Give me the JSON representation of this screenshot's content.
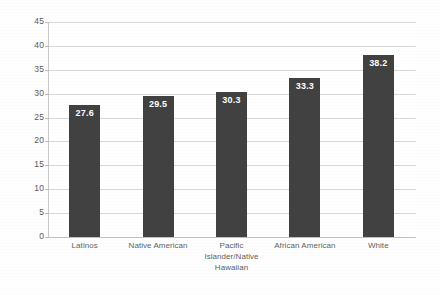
{
  "chart_data": {
    "type": "bar",
    "title": "",
    "subtitle": "",
    "xlabel": "",
    "ylabel": "",
    "categories": [
      "Latinos",
      "Native American",
      "Pacific Islander/Native Hawaiian",
      "African American",
      "White"
    ],
    "category_lines": [
      [
        "Latinos"
      ],
      [
        "Native American"
      ],
      [
        "Pacific",
        "Islander/Native",
        "Hawaiian"
      ],
      [
        "African American"
      ],
      [
        "White"
      ]
    ],
    "values": [
      27.6,
      29.5,
      30.3,
      33.3,
      38.2
    ],
    "data_labels": [
      "27.6",
      "29.5",
      "30.3",
      "33.3",
      "38.2"
    ],
    "ylim": [
      0,
      45
    ],
    "ytick_step": 5,
    "yticks": [
      0,
      5,
      10,
      15,
      20,
      25,
      30,
      35,
      40,
      45
    ],
    "ytick_labels": [
      "0",
      "5",
      "10",
      "15",
      "20",
      "25",
      "30",
      "35",
      "40",
      "45"
    ],
    "grid": true,
    "grid_axis": "y",
    "legend": false,
    "legend_position": "none",
    "bar_color": "#414141",
    "grid_color": "#d8d8d8",
    "axis_color": "#c8c8c8",
    "label_text_color": "#ffffff",
    "tick_text_color": "#5b5b5b",
    "plot_background": "#ffffff",
    "page_background": "#fefefe"
  }
}
